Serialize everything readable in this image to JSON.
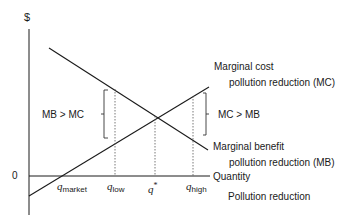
{
  "axes": {
    "y_label": "$",
    "origin_label": "0",
    "x_label": "Quantity",
    "x_sublabel": "Pollution reduction"
  },
  "curves": {
    "mc": {
      "line1": "Marginal cost",
      "line2": "pollution reduction (MC)"
    },
    "mb": {
      "line1": "Marginal benefit",
      "line2": "pollution reduction (MB)"
    }
  },
  "brackets": {
    "left": "MB > MC",
    "right": "MC > MB"
  },
  "ticks": [
    {
      "sym": "q",
      "sub": "market"
    },
    {
      "sym": "q",
      "sub": "low"
    },
    {
      "sym": "q",
      "sub": "*"
    },
    {
      "sym": "q",
      "sub": "high"
    }
  ],
  "colors": {
    "line": "#1a1a1a",
    "dotted": "#555555",
    "bracket": "#333333"
  }
}
